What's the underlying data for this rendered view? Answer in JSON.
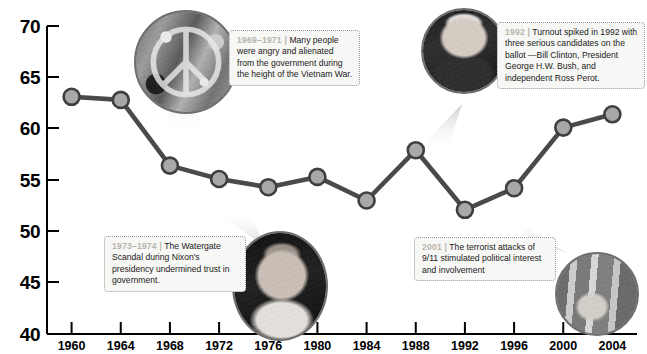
{
  "chart_data": {
    "type": "line",
    "title": "",
    "subtitle": "",
    "xlabel": "",
    "ylabel": "",
    "ylim": [
      40,
      70
    ],
    "yticks": [
      40,
      45,
      50,
      55,
      60,
      65,
      70
    ],
    "ytick_labels": [
      "40",
      "45",
      "50",
      "55",
      "60",
      "65",
      "70"
    ],
    "grid": false,
    "legend": "none",
    "categories": [
      "1960",
      "1964",
      "1968",
      "1972",
      "1976",
      "1980",
      "1984",
      "1988",
      "1992",
      "1996",
      "2000",
      "2004"
    ],
    "x": [
      1960,
      1964,
      1968,
      1972,
      1976,
      1980,
      1984,
      1988,
      1992,
      1996,
      2000,
      2004
    ],
    "values": [
      63.1,
      62.8,
      56.4,
      55.1,
      54.3,
      55.3,
      53.0,
      57.9,
      52.1,
      54.2,
      60.1,
      61.4
    ],
    "series": [
      {
        "name": "Voter turnout",
        "values": [
          63.1,
          62.8,
          56.4,
          55.1,
          54.3,
          55.3,
          53.0,
          57.9,
          52.1,
          54.2,
          60.1,
          61.4
        ]
      }
    ],
    "line_color": "#4a4a4a",
    "marker_color": "#a8a8a8",
    "marker_edge_color": "#3f3f3f"
  },
  "axis": {
    "y_labels": [
      "70",
      "65",
      "60",
      "55",
      "50",
      "45",
      "40"
    ],
    "x_labels": [
      "1960",
      "1964",
      "1968",
      "1972",
      "1976",
      "1980",
      "1984",
      "1988",
      "1992",
      "1996",
      "2000",
      "2004"
    ]
  },
  "annotations": [
    {
      "id": "vietnam",
      "year": "1969–1971",
      "text": "Many people were angry and alienated from the government during the height of the Vietnam War.",
      "photo": "peace-sign-photo",
      "photo_alt": "peace-sign-icon"
    },
    {
      "id": "clinton",
      "year": "1992",
      "text": "Turnout spiked in 1992 with three serious candidates on the ballot —Bill Clinton, President George H.W. Bush, and independent Ross Perot.",
      "photo": "bill-clinton-photo",
      "photo_alt": "portrait-icon"
    },
    {
      "id": "watergate",
      "year": "1973–1974",
      "text": "The Watergate Scandal during Nixon's presidency undermined trust in government.",
      "photo": "richard-nixon-photo",
      "photo_alt": "portrait-icon"
    },
    {
      "id": "september11",
      "year": "2001",
      "text": "The terrorist attacks of 9/11 stimulated political interest and involvement",
      "photo": "september-11-photo",
      "photo_alt": "memorial-icon"
    }
  ],
  "colors": {
    "line": "#4a4a4a",
    "marker_fill": "#a8a8a8",
    "marker_edge": "#3f3f3f",
    "axis": "#000000",
    "callout_bg": "#f7f7f5",
    "callout_border": "#9a9a9a",
    "callout_year_text": "#b9b4ac",
    "callout_text": "#1a1a1a",
    "bubble_border": "#6f6f6f"
  }
}
